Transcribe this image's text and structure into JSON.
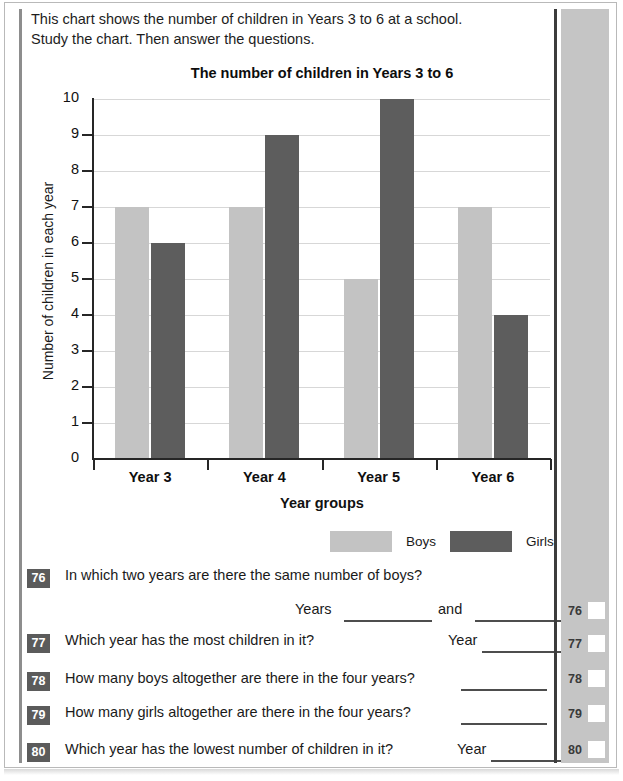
{
  "intro": {
    "line1": "This chart shows the number of children in Years 3 to 6 at a school.",
    "line2": "Study the chart. Then answer the questions."
  },
  "chart_data": {
    "type": "bar",
    "title": "The number of children in Years 3 to 6",
    "xlabel": "Year groups",
    "ylabel": "Number of children in each year",
    "categories": [
      "Year 3",
      "Year 4",
      "Year 5",
      "Year 6"
    ],
    "series": [
      {
        "name": "Boys",
        "color": "#c3c3c3",
        "values": [
          7,
          7,
          5,
          7
        ]
      },
      {
        "name": "Girls",
        "color": "#5d5d5d",
        "values": [
          6,
          9,
          10,
          4
        ]
      }
    ],
    "ylim": [
      0,
      10
    ],
    "yticks": [
      10,
      9,
      8,
      7,
      6,
      5,
      4,
      3,
      2,
      1,
      0
    ],
    "grid": true,
    "legend_position": "bottom-right"
  },
  "questions": [
    {
      "number": "76",
      "text": "In which two years are there the same number of boys?",
      "answer_lead": "Years",
      "answer_lead2": "and",
      "answer_value": "",
      "answer_value2": ""
    },
    {
      "number": "77",
      "text": "Which year has the most children in it?",
      "answer_lead": "Year",
      "answer_value": ""
    },
    {
      "number": "78",
      "text": "How many boys altogether are there in the four years?",
      "answer_lead": "",
      "answer_value": ""
    },
    {
      "number": "79",
      "text": "How many girls altogether are there in the four years?",
      "answer_lead": "",
      "answer_value": ""
    },
    {
      "number": "80",
      "text": "Which year has the lowest number of children in it?",
      "answer_lead": "Year",
      "answer_value": ""
    }
  ],
  "margin_marks": [
    {
      "number": "76",
      "mark": ""
    },
    {
      "number": "77",
      "mark": ""
    },
    {
      "number": "78",
      "mark": ""
    },
    {
      "number": "79",
      "mark": ""
    },
    {
      "number": "80",
      "mark": ""
    }
  ]
}
